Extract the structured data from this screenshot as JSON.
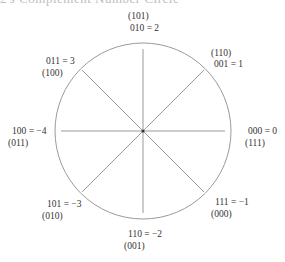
{
  "heading": "2's Complement Number Circle",
  "diagram": {
    "type": "number-circle",
    "center": [
      143,
      131
    ],
    "radius": 88,
    "stroke_color": "#9a9a9a",
    "spoke_angles_deg": [
      0,
      45,
      90,
      135,
      180,
      225,
      270,
      315
    ]
  },
  "labels": {
    "top": {
      "line1": "(101)",
      "line2": "010 = 2"
    },
    "top_right": {
      "line1": "(110)",
      "line2": "001 = 1"
    },
    "right": {
      "line1": "000 = 0",
      "line2": "(111)"
    },
    "bottom_right": {
      "line1": "111 = −1",
      "line2": "(000)"
    },
    "bottom": {
      "line1": "110 = −2",
      "line2": "(001)"
    },
    "bottom_left": {
      "line1": "101 = −3",
      "line2": "(010)"
    },
    "left": {
      "line1": "100 = −4",
      "line2": "(011)"
    },
    "top_left": {
      "line1": "011 = 3",
      "line2": "(100)"
    }
  }
}
